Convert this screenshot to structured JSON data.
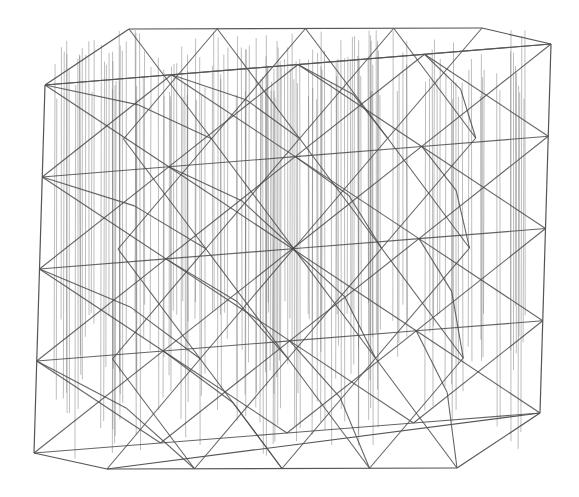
{
  "diagram": {
    "type": "3d-wireframe-lattice",
    "style": "pencil-sketch",
    "colors": {
      "background": "#ffffff",
      "line": "#4a4a4a",
      "hatch": "#6a6a6a"
    },
    "hull_vertices": [
      [
        129,
        29
      ],
      [
        482,
        28
      ],
      [
        551,
        44
      ],
      [
        540,
        413
      ],
      [
        457,
        468
      ],
      [
        107,
        469
      ],
      [
        34,
        453
      ],
      [
        45,
        85
      ]
    ],
    "inner_hull_top": [
      [
        129,
        29
      ],
      [
        482,
        28
      ],
      [
        551,
        44
      ],
      [
        45,
        85
      ]
    ],
    "grid": {
      "rows": 4,
      "cols": 4,
      "origin": [
        45,
        85
      ],
      "x_step": [
        125,
        -10
      ],
      "y_step": [
        -3,
        92
      ]
    }
  }
}
